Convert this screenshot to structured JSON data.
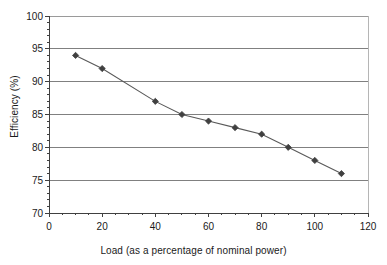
{
  "chart_data": {
    "type": "line",
    "title": "",
    "xlabel": "Load (as a percentage of nominal power)",
    "ylabel": "Efficiency (%)",
    "xlim": [
      0,
      120
    ],
    "ylim": [
      70,
      100
    ],
    "xticks": [
      0,
      20,
      40,
      60,
      80,
      100,
      120
    ],
    "xticklabels": [
      "0",
      "20",
      "40",
      "60",
      "80",
      "100",
      "120"
    ],
    "x_minor_tick_step": 5,
    "yticks": [
      70,
      75,
      80,
      85,
      90,
      95,
      100
    ],
    "yticklabels": [
      "70",
      "75",
      "80",
      "85",
      "90",
      "95",
      "100"
    ],
    "y_minor_tick_step": 1,
    "grid": "horizontal",
    "legend": "none",
    "marker": "diamond",
    "line_color": "#595959",
    "marker_color": "#404040",
    "grid_color": "#808080",
    "axis_color": "#404040",
    "x": [
      10,
      20,
      40,
      50,
      60,
      70,
      80,
      90,
      100,
      110
    ],
    "values": [
      94,
      92,
      87,
      85,
      84,
      83,
      82,
      80,
      78,
      76
    ],
    "series": [
      {
        "name": "Efficiency",
        "x": [
          10,
          20,
          40,
          50,
          60,
          70,
          80,
          90,
          100,
          110
        ],
        "values": [
          94,
          92,
          87,
          85,
          84,
          83,
          82,
          80,
          78,
          76
        ]
      }
    ]
  },
  "axes": {
    "y_title": "Efficiency (%)",
    "x_title": "Load (as a percentage of nominal power)"
  }
}
